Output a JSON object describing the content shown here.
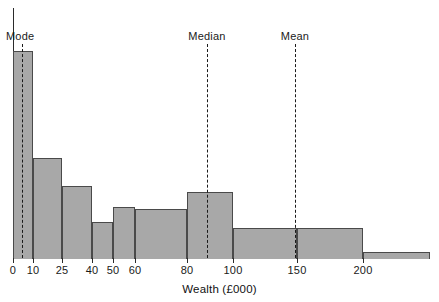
{
  "chart_data": {
    "type": "bar",
    "title": "",
    "subtitle": "",
    "xlabel": "Wealth (£000)",
    "ylabel": "",
    "grid": false,
    "legend": "none",
    "xlim": [
      0,
      250
    ],
    "ylim": [
      0,
      1
    ],
    "bin_edges": [
      0,
      10,
      25,
      40,
      50,
      60,
      80,
      100,
      150,
      200,
      250
    ],
    "tick_labels": [
      "0",
      "10",
      "25",
      "40",
      "50",
      "60",
      "80",
      "100",
      "150",
      "200"
    ],
    "tick_values": [
      0,
      10,
      25,
      40,
      50,
      60,
      80,
      100,
      150,
      200
    ],
    "categories": [
      "0-10",
      "10-25",
      "25-40",
      "40-50",
      "50-60",
      "60-80",
      "80-100",
      "100-150",
      "150-200",
      "200-250"
    ],
    "values": [
      1.0,
      0.483,
      0.348,
      0.174,
      0.246,
      0.237,
      0.319,
      0.145,
      0.145,
      0.029
    ],
    "bar_pixel_tops": [
      51,
      158,
      186,
      222,
      207,
      209,
      192,
      228,
      228,
      252
    ],
    "baseline_pixel": 258,
    "bar_pixel_edges": [
      13,
      33,
      62,
      92,
      113,
      135,
      187,
      233,
      297,
      363,
      430
    ],
    "bar_fill_color": "#a8a8a8",
    "bar_edge_color": "#4a4a4a",
    "axis_color": "#2b2b2b",
    "annotations": [
      {
        "name": "Mode",
        "x_value": 6,
        "x_pixel": 22,
        "label_x_pixel": 6,
        "label_align": "left"
      },
      {
        "name": "Median",
        "x_value": 92,
        "x_pixel": 207,
        "label_x_pixel": 207,
        "label_align": "center"
      },
      {
        "name": "Mean",
        "x_value": 148,
        "x_pixel": 295,
        "label_x_pixel": 295,
        "label_align": "center"
      }
    ],
    "annotation_label_y_pixel": 30,
    "annotation_line_top_pixel": 44,
    "annotation_line_bottom_pixel": 258
  }
}
